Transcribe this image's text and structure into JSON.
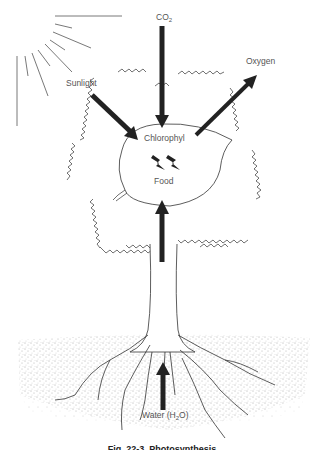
{
  "diagram": {
    "title": "Photosynthesis",
    "caption": "Fig. 22-3. Photosynthesis",
    "labels": {
      "sunlight": "Sunlight",
      "co2_main": "CO",
      "co2_sub": "2",
      "oxygen": "Oxygen",
      "chlorophyl": "Chlorophyl",
      "food": "Food",
      "water_main": "Water (H",
      "water_sub": "2",
      "water_end": "O)"
    },
    "arrows": [
      {
        "name": "sunlight-arrow",
        "from": "Sunlight",
        "to": "Chlorophyl",
        "direction": "in"
      },
      {
        "name": "co2-arrow",
        "from": "CO2",
        "to": "Chlorophyl",
        "direction": "in"
      },
      {
        "name": "oxygen-arrow",
        "from": "Chlorophyl",
        "to": "Oxygen",
        "direction": "out"
      },
      {
        "name": "food-arrow",
        "from": "Trunk",
        "to": "Food",
        "direction": "in"
      },
      {
        "name": "water-arrow",
        "from": "Roots",
        "to": "Trunk",
        "direction": "in"
      }
    ],
    "colors": {
      "ink": "#222222",
      "label": "#555555",
      "soil": "#666666",
      "background": "#ffffff"
    }
  }
}
